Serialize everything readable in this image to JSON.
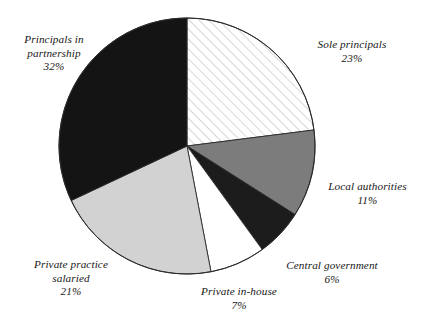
{
  "chart_data": {
    "type": "pie",
    "title": "",
    "subtitle": "",
    "xlabel": "",
    "ylabel": "",
    "legend_position": "none",
    "grid": false,
    "units": "percent",
    "start_angle_deg": 0,
    "direction": "clockwise",
    "total": 100,
    "categories": [
      "Sole principals",
      "Local authorities",
      "Central government",
      "Private in-house",
      "Private practice salaried",
      "Principals in partnership"
    ],
    "values": [
      23,
      11,
      6,
      7,
      21,
      32
    ],
    "slices": [
      {
        "label": "Sole principals",
        "value": 23,
        "value_label": "23%",
        "fill": "diagonal-hatch-light",
        "fill_color": "#ffffff",
        "hatch_color": "#b0b0b0",
        "stroke": "#2b2b2b",
        "start_deg": 0,
        "end_deg": 82.8
      },
      {
        "label": "Local authorities",
        "value": 11,
        "value_label": "11%",
        "fill": "solid",
        "fill_color": "#7c7c7c",
        "hatch_color": "",
        "stroke": "#2b2b2b",
        "start_deg": 82.8,
        "end_deg": 122.4
      },
      {
        "label": "Central government",
        "value": 6,
        "value_label": "6%",
        "fill": "solid",
        "fill_color": "#1c1c1c",
        "hatch_color": "",
        "stroke": "#2b2b2b",
        "start_deg": 122.4,
        "end_deg": 144.0
      },
      {
        "label": "Private in-house",
        "value": 7,
        "value_label": "7%",
        "fill": "solid",
        "fill_color": "#ffffff",
        "hatch_color": "",
        "stroke": "#2b2b2b",
        "start_deg": 144.0,
        "end_deg": 169.2
      },
      {
        "label": "Private practice salaried",
        "value": 21,
        "value_label": "21%",
        "fill": "solid",
        "fill_color": "#d2d2d2",
        "hatch_color": "",
        "stroke": "#2b2b2b",
        "start_deg": 169.2,
        "end_deg": 244.8
      },
      {
        "label": "Principals in partnership",
        "value": 32,
        "value_label": "32%",
        "fill": "solid",
        "fill_color": "#141414",
        "hatch_color": "",
        "stroke": "#2b2b2b",
        "start_deg": 244.8,
        "end_deg": 360.0
      }
    ]
  },
  "labels": {
    "principals_partnership": {
      "line1": "Principals in",
      "line2": "partnership",
      "value": "32%"
    },
    "sole_principals": {
      "line1": "Sole principals",
      "value": "23%"
    },
    "local_authorities": {
      "line1": "Local authorities",
      "value": "11%"
    },
    "central_government": {
      "line1": "Central government",
      "value": "6%"
    },
    "private_in_house": {
      "line1": "Private in-house",
      "value": "7%"
    },
    "private_practice_salaried": {
      "line1": "Private practice",
      "line2": "salaried",
      "value": "21%"
    }
  },
  "colors": {
    "background": "#ffffff",
    "text": "#171717",
    "outline": "#2b2b2b",
    "black_slice": "#141414",
    "dark_slice": "#1c1c1c",
    "mid_gray_slice": "#7c7c7c",
    "light_gray_slice": "#d2d2d2",
    "white_slice": "#ffffff",
    "hatch_line": "#b0b0b0"
  },
  "geometry": {
    "center_x": 187,
    "center_y": 146,
    "radius": 128
  }
}
